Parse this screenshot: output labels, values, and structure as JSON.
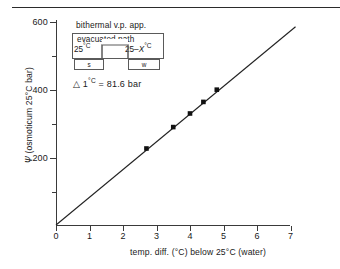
{
  "figure": {
    "has_top_rule": true,
    "background_color": "#ffffff",
    "line_color": "#222222",
    "marker_color": "#111111"
  },
  "inset": {
    "title": "bithermal v.p. app.",
    "outer_label": "evacuated path",
    "left_temp": "25",
    "left_temp_unit": "°C",
    "right_temp_prefix": "25–",
    "right_temp_var": "X",
    "right_temp_unit": "°C",
    "vessel_left": "s",
    "vessel_right": "w"
  },
  "annotation": {
    "symbol": "△",
    "text": "1°C = 81.6 bar",
    "full": "△ 1°C = 81.6 bar"
  },
  "chart_data": {
    "type": "scatter",
    "title": "",
    "xlabel": "temp. diff. (°C) below 25°C (water)",
    "ylabel": "Ψ (osmoticum 25°C bar)",
    "ylabel_symbol": "Ψ",
    "ylabel_rest": "(osmoticum 25°C bar)",
    "xlim": [
      0,
      7.6
    ],
    "ylim": [
      0,
      620
    ],
    "grid": false,
    "legend": null,
    "x_ticks_major": [
      0,
      1,
      2,
      3,
      4,
      5,
      6,
      7
    ],
    "x_tick_labels": [
      "0",
      "1",
      "2",
      "3",
      "4",
      "5",
      "6",
      "7"
    ],
    "x_ticks_minor": [
      0.5,
      1.5,
      2.5,
      3.5,
      4.5,
      5.5,
      6.5
    ],
    "y_ticks_major": [
      200,
      400,
      600
    ],
    "y_tick_labels": [
      "200",
      "400",
      "600"
    ],
    "y_ticks_minor": [
      100,
      300,
      500
    ],
    "series": [
      {
        "name": "measurements",
        "marker": "filled-square",
        "x": [
          2.7,
          3.5,
          4.0,
          4.4,
          4.8
        ],
        "y": [
          225,
          288,
          328,
          362,
          398
        ]
      },
      {
        "name": "fitted line",
        "type": "line",
        "slope": 81.6,
        "intercept": 0,
        "x": [
          0,
          7.15
        ],
        "y": [
          0,
          583
        ]
      }
    ]
  }
}
